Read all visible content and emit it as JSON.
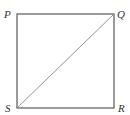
{
  "diagram": {
    "type": "square-with-diagonal",
    "colors": {
      "stroke": "#666666",
      "diagonal": "#777777",
      "label": "#333333",
      "background": "#ffffff"
    },
    "vertices": [
      {
        "name": "P",
        "x": 17,
        "y": 14
      },
      {
        "name": "Q",
        "x": 114,
        "y": 14
      },
      {
        "name": "R",
        "x": 114,
        "y": 108
      },
      {
        "name": "S",
        "x": 17,
        "y": 108
      }
    ],
    "edges": [
      "PQ",
      "QR",
      "RS",
      "SP"
    ],
    "diagonals": [
      "SQ"
    ],
    "labels": {
      "P": "P",
      "Q": "Q",
      "R": "R",
      "S": "S"
    }
  }
}
